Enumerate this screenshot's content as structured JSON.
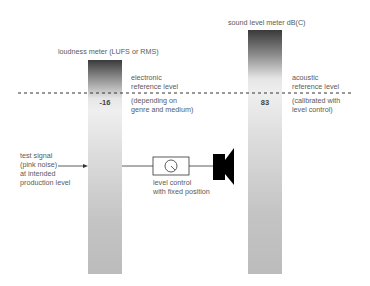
{
  "meters": {
    "loudness": {
      "title": "loudness meter (LUFS or RMS)",
      "value": "-16",
      "ref_label": "electronic\nreference level",
      "ref_note": "(depending on\ngenre and medium)"
    },
    "spl": {
      "title": "sound level meter dB(C)",
      "value": "83",
      "ref_label": "acoustic\nreference level",
      "ref_note": "(calibrated with\nlevel control)"
    }
  },
  "signal": {
    "label": "test signal\n(pink noise)\nat intended\nproduction level"
  },
  "level_control": {
    "label": "level control\nwith fixed position"
  },
  "colors": {
    "bar_top": "#3a3a3a",
    "bar_light": "#efefef",
    "bar_bottom": "#bdbdbd",
    "line": "#333333"
  }
}
